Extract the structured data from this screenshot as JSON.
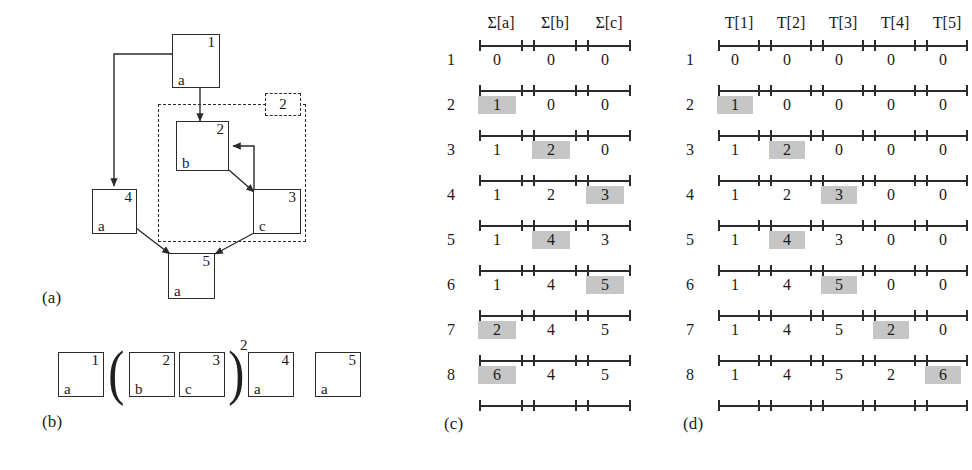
{
  "figure": {
    "panels": [
      {
        "id": "a",
        "label": "(a)"
      },
      {
        "id": "b",
        "label": "(b)"
      },
      {
        "id": "c",
        "label": "(c)"
      },
      {
        "id": "d",
        "label": "(d)"
      }
    ]
  },
  "graph": {
    "nodes": [
      {
        "num": "1",
        "letter": "a"
      },
      {
        "num": "2",
        "letter": "b"
      },
      {
        "num": "3",
        "letter": "c"
      },
      {
        "num": "4",
        "letter": "a"
      },
      {
        "num": "5",
        "letter": "a"
      }
    ],
    "group_tag": "2"
  },
  "expression": {
    "items": [
      {
        "num": "1",
        "letter": "a"
      },
      {
        "num": "2",
        "letter": "b"
      },
      {
        "num": "3",
        "letter": "c"
      },
      {
        "num": "4",
        "letter": "a"
      },
      {
        "num": "5",
        "letter": "a"
      }
    ],
    "open_paren": "(",
    "close_paren": ")",
    "exponent": "2"
  },
  "table_c": {
    "headers": [
      "Σ[a]",
      "Σ[b]",
      "Σ[c]"
    ],
    "row_labels": [
      "1",
      "2",
      "3",
      "4",
      "5",
      "6",
      "7",
      "8"
    ],
    "rows": [
      [
        {
          "v": "0",
          "hl": false
        },
        {
          "v": "0",
          "hl": false
        },
        {
          "v": "0",
          "hl": false
        }
      ],
      [
        {
          "v": "1",
          "hl": true
        },
        {
          "v": "0",
          "hl": false
        },
        {
          "v": "0",
          "hl": false
        }
      ],
      [
        {
          "v": "1",
          "hl": false
        },
        {
          "v": "2",
          "hl": true
        },
        {
          "v": "0",
          "hl": false
        }
      ],
      [
        {
          "v": "1",
          "hl": false
        },
        {
          "v": "2",
          "hl": false
        },
        {
          "v": "3",
          "hl": true
        }
      ],
      [
        {
          "v": "1",
          "hl": false
        },
        {
          "v": "4",
          "hl": true
        },
        {
          "v": "3",
          "hl": false
        }
      ],
      [
        {
          "v": "1",
          "hl": false
        },
        {
          "v": "4",
          "hl": false
        },
        {
          "v": "5",
          "hl": true
        }
      ],
      [
        {
          "v": "2",
          "hl": true
        },
        {
          "v": "4",
          "hl": false
        },
        {
          "v": "5",
          "hl": false
        }
      ],
      [
        {
          "v": "6",
          "hl": true
        },
        {
          "v": "4",
          "hl": false
        },
        {
          "v": "5",
          "hl": false
        }
      ]
    ]
  },
  "table_d": {
    "headers": [
      "T[1]",
      "T[2]",
      "T[3]",
      "T[4]",
      "T[5]"
    ],
    "row_labels": [
      "1",
      "2",
      "3",
      "4",
      "5",
      "6",
      "7",
      "8"
    ],
    "rows": [
      [
        {
          "v": "0",
          "hl": false
        },
        {
          "v": "0",
          "hl": false
        },
        {
          "v": "0",
          "hl": false
        },
        {
          "v": "0",
          "hl": false
        },
        {
          "v": "0",
          "hl": false
        }
      ],
      [
        {
          "v": "1",
          "hl": true
        },
        {
          "v": "0",
          "hl": false
        },
        {
          "v": "0",
          "hl": false
        },
        {
          "v": "0",
          "hl": false
        },
        {
          "v": "0",
          "hl": false
        }
      ],
      [
        {
          "v": "1",
          "hl": false
        },
        {
          "v": "2",
          "hl": true
        },
        {
          "v": "0",
          "hl": false
        },
        {
          "v": "0",
          "hl": false
        },
        {
          "v": "0",
          "hl": false
        }
      ],
      [
        {
          "v": "1",
          "hl": false
        },
        {
          "v": "2",
          "hl": false
        },
        {
          "v": "3",
          "hl": true
        },
        {
          "v": "0",
          "hl": false
        },
        {
          "v": "0",
          "hl": false
        }
      ],
      [
        {
          "v": "1",
          "hl": false
        },
        {
          "v": "4",
          "hl": true
        },
        {
          "v": "3",
          "hl": false
        },
        {
          "v": "0",
          "hl": false
        },
        {
          "v": "0",
          "hl": false
        }
      ],
      [
        {
          "v": "1",
          "hl": false
        },
        {
          "v": "4",
          "hl": false
        },
        {
          "v": "5",
          "hl": true
        },
        {
          "v": "0",
          "hl": false
        },
        {
          "v": "0",
          "hl": false
        }
      ],
      [
        {
          "v": "1",
          "hl": false
        },
        {
          "v": "4",
          "hl": false
        },
        {
          "v": "5",
          "hl": false
        },
        {
          "v": "2",
          "hl": true
        },
        {
          "v": "0",
          "hl": false
        }
      ],
      [
        {
          "v": "1",
          "hl": false
        },
        {
          "v": "4",
          "hl": false
        },
        {
          "v": "5",
          "hl": false
        },
        {
          "v": "2",
          "hl": false
        },
        {
          "v": "6",
          "hl": true
        }
      ]
    ]
  },
  "colors": {
    "ink": "#2b2b2b",
    "highlight": "#c6c6c6",
    "background": "#ffffff"
  }
}
